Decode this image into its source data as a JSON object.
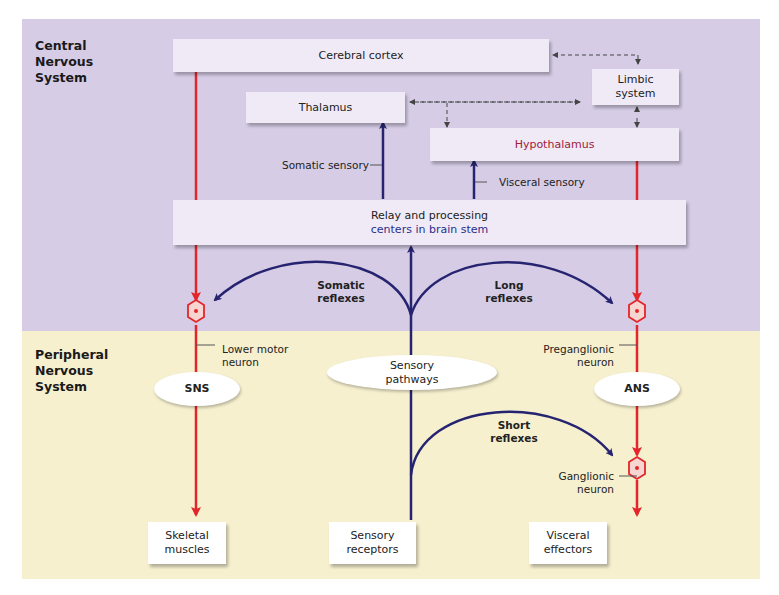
{
  "regions": {
    "cns": {
      "label_lines": [
        "Central",
        "Nervous",
        "System"
      ],
      "color": "#d6cce6"
    },
    "pns": {
      "label_lines": [
        "Peripheral",
        "Nervous",
        "System"
      ],
      "color": "#f6f0cf"
    }
  },
  "boxes": {
    "cerebral_cortex": "Cerebral cortex",
    "thalamus": "Thalamus",
    "limbic_system": [
      "Limbic",
      "system"
    ],
    "hypothalamus": "Hypothalamus",
    "relay": [
      "Relay and processing",
      "centers in brain stem"
    ],
    "skeletal_muscles": [
      "Skeletal",
      "muscles"
    ],
    "sensory_receptors": [
      "Sensory",
      "receptors"
    ],
    "visceral_effectors": [
      "Visceral",
      "effectors"
    ]
  },
  "ovals": {
    "sns": "SNS",
    "ans": "ANS",
    "sensory_pathways": [
      "Sensory",
      "pathways"
    ]
  },
  "labels": {
    "somatic_sensory": "Somatic sensory",
    "visceral_sensory": "Visceral sensory",
    "somatic_reflexes": [
      "Somatic",
      "reflexes"
    ],
    "long_reflexes": [
      "Long",
      "reflexes"
    ],
    "short_reflexes": [
      "Short",
      "reflexes"
    ],
    "lower_motor_neuron": [
      "Lower motor",
      "neuron"
    ],
    "preganglionic_neuron": [
      "Preganglionic",
      "neuron"
    ],
    "ganglionic_neuron": [
      "Ganglionic",
      "neuron"
    ]
  },
  "colors": {
    "motor_red": "#e3262a",
    "sensory_blue": "#262470",
    "dashed": "#444444",
    "box_fill": "#efeaf6",
    "hypothalamus_text": "#a0213a",
    "relay_second_line": "#2a2f8a"
  }
}
